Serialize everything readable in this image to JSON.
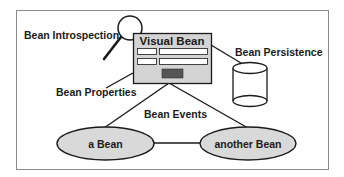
{
  "diagram": {
    "nodes": {
      "visual_bean": {
        "label": "Visual Bean"
      },
      "a_bean": {
        "label": "a Bean"
      },
      "another_bean": {
        "label": "another Bean"
      },
      "persistence_store": {
        "icon": "database-cylinder-icon"
      },
      "introspection_tool": {
        "icon": "magnifying-glass-icon"
      }
    },
    "labels": {
      "introspection": "Bean Introspection",
      "persistence": "Bean Persistence",
      "properties": "Bean Properties",
      "events": "Bean Events"
    },
    "edges": [
      {
        "from": "visual_bean",
        "to": "a_bean"
      },
      {
        "from": "visual_bean",
        "to": "another_bean"
      },
      {
        "from": "a_bean",
        "to": "another_bean"
      },
      {
        "from": "visual_bean",
        "to": "persistence_store"
      },
      {
        "from": "visual_bean",
        "to": "properties_label"
      }
    ],
    "colors": {
      "stroke": "#1a1a1a",
      "box_fill": "#d4d4d4",
      "ellipse_fill": "#d9d9d9",
      "button_fill": "#555555",
      "frame": "#8a8a8a"
    }
  }
}
